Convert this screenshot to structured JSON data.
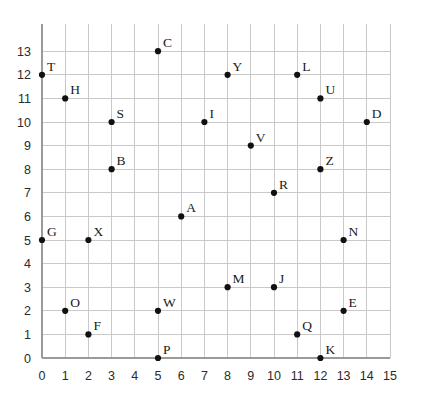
{
  "chart_data": {
    "type": "scatter",
    "title": "",
    "xlabel": "",
    "ylabel": "",
    "xlim": [
      -0.3,
      15.0
    ],
    "ylim": [
      -0.55,
      14.15
    ],
    "grid": true,
    "legend": "none",
    "xticks": [
      0,
      1,
      2,
      3,
      4,
      5,
      6,
      7,
      8,
      9,
      10,
      11,
      12,
      13,
      14,
      15
    ],
    "yticks": [
      0,
      1,
      2,
      3,
      4,
      5,
      6,
      7,
      8,
      9,
      10,
      11,
      12,
      13
    ],
    "xtick_labels": [
      "0",
      "1",
      "2",
      "3",
      "4",
      "5",
      "6",
      "7",
      "8",
      "9",
      "10",
      "11",
      "12",
      "13",
      "14",
      "15"
    ],
    "ytick_labels": [
      "0",
      "1",
      "2",
      "3",
      "4",
      "5",
      "6",
      "7",
      "8",
      "9",
      "10",
      "11",
      "12",
      "13"
    ],
    "point_color": "#111111",
    "grid_color": "#c9c9c9",
    "axis_color": "#9a9a9a",
    "background_color": "#ffffff",
    "label_position": "upper-right",
    "points": [
      {
        "label": "A",
        "x": 6,
        "y": 6
      },
      {
        "label": "B",
        "x": 3,
        "y": 8
      },
      {
        "label": "C",
        "x": 5,
        "y": 13
      },
      {
        "label": "D",
        "x": 14,
        "y": 10
      },
      {
        "label": "E",
        "x": 13,
        "y": 2
      },
      {
        "label": "F",
        "x": 2,
        "y": 1
      },
      {
        "label": "G",
        "x": 0,
        "y": 5
      },
      {
        "label": "H",
        "x": 1,
        "y": 11
      },
      {
        "label": "I",
        "x": 7,
        "y": 10
      },
      {
        "label": "J",
        "x": 10,
        "y": 3
      },
      {
        "label": "K",
        "x": 12,
        "y": 0
      },
      {
        "label": "L",
        "x": 11,
        "y": 12
      },
      {
        "label": "M",
        "x": 8,
        "y": 3
      },
      {
        "label": "N",
        "x": 13,
        "y": 5
      },
      {
        "label": "O",
        "x": 1,
        "y": 2
      },
      {
        "label": "P",
        "x": 5,
        "y": 0
      },
      {
        "label": "Q",
        "x": 11,
        "y": 1
      },
      {
        "label": "R",
        "x": 10,
        "y": 7
      },
      {
        "label": "S",
        "x": 3,
        "y": 10
      },
      {
        "label": "T",
        "x": 0,
        "y": 12
      },
      {
        "label": "U",
        "x": 12,
        "y": 11
      },
      {
        "label": "V",
        "x": 9,
        "y": 9
      },
      {
        "label": "W",
        "x": 5,
        "y": 2
      },
      {
        "label": "X",
        "x": 2,
        "y": 5
      },
      {
        "label": "Y",
        "x": 8,
        "y": 12
      },
      {
        "label": "Z",
        "x": 12,
        "y": 8
      }
    ]
  }
}
